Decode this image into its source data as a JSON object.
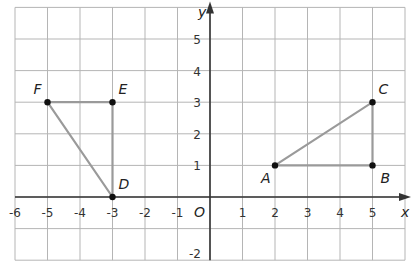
{
  "diagram": {
    "type": "coordinate-plane",
    "x_range": [
      -6,
      6
    ],
    "y_range": [
      -2,
      6
    ],
    "x_axis_label": "x",
    "y_axis_label": "y",
    "origin_label": "O",
    "x_tick_labels": [
      "-6",
      "-5",
      "-4",
      "-3",
      "-2",
      "-1",
      "1",
      "2",
      "3",
      "4",
      "5"
    ],
    "y_tick_labels": [
      "5",
      "4",
      "3",
      "2",
      "1",
      "-2"
    ],
    "colors": {
      "grid": "#b5b5b5",
      "axis": "#333333",
      "segment": "#9a9a9a",
      "point": "#111111"
    },
    "points": [
      {
        "name": "A",
        "x": 2,
        "y": 1
      },
      {
        "name": "B",
        "x": 5,
        "y": 1
      },
      {
        "name": "C",
        "x": 5,
        "y": 3
      },
      {
        "name": "D",
        "x": -3,
        "y": 0
      },
      {
        "name": "E",
        "x": -3,
        "y": 3
      },
      {
        "name": "F",
        "x": -5,
        "y": 3
      }
    ],
    "triangles": [
      {
        "name": "ABC",
        "vertices": [
          "A",
          "B",
          "C"
        ]
      },
      {
        "name": "DEF",
        "vertices": [
          "D",
          "E",
          "F"
        ]
      }
    ]
  }
}
